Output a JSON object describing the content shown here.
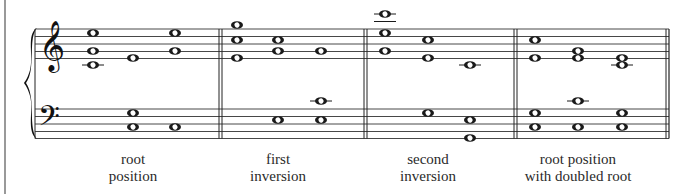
{
  "figure": {
    "colors": {
      "ink": "#1a1a1a",
      "background": "#ffffff"
    }
  },
  "staves": {
    "treble_clef": "treble-clef",
    "bass_clef": "bass-clef",
    "treble_lines_y": [
      29,
      36.5,
      44,
      51.5,
      58.5
    ],
    "bass_lines_y": [
      109,
      116.5,
      124,
      131.5,
      138.5
    ]
  },
  "measures": [
    {
      "label_line1": "root",
      "label_line2": "position",
      "label_x": 133,
      "chords": [
        {
          "x": 93,
          "notes": [
            {
              "y": 33,
              "staff": "treble"
            },
            {
              "y": 51,
              "staff": "treble"
            },
            {
              "y": 65,
              "staff": "treble",
              "ledger": true
            }
          ]
        },
        {
          "x": 133,
          "notes": [
            {
              "y": 58,
              "staff": "treble"
            },
            {
              "y": 113,
              "staff": "bass"
            },
            {
              "y": 127,
              "staff": "bass"
            }
          ]
        },
        {
          "x": 175,
          "notes": [
            {
              "y": 33,
              "staff": "treble"
            },
            {
              "y": 51,
              "staff": "treble"
            },
            {
              "y": 127,
              "staff": "bass"
            }
          ]
        }
      ]
    },
    {
      "label_line1": "first",
      "label_line2": "inversion",
      "label_x": 278,
      "chords": [
        {
          "x": 237,
          "notes": [
            {
              "y": 25,
              "staff": "treble"
            },
            {
              "y": 40,
              "staff": "treble"
            },
            {
              "y": 58,
              "staff": "treble"
            }
          ]
        },
        {
          "x": 278,
          "notes": [
            {
              "y": 40,
              "staff": "treble"
            },
            {
              "y": 51,
              "staff": "treble"
            },
            {
              "y": 120,
              "staff": "bass"
            }
          ]
        },
        {
          "x": 321,
          "notes": [
            {
              "y": 51,
              "staff": "treble"
            },
            {
              "y": 101,
              "staff": "bass",
              "ledger": true
            },
            {
              "y": 120,
              "staff": "bass"
            }
          ]
        }
      ]
    },
    {
      "label_line1": "second",
      "label_line2": "inversion",
      "label_x": 428,
      "chords": [
        {
          "x": 385,
          "notes": [
            {
              "y": 14,
              "staff": "treble",
              "ledger_above": true
            },
            {
              "y": 33,
              "staff": "treble"
            },
            {
              "y": 51,
              "staff": "treble"
            }
          ]
        },
        {
          "x": 428,
          "notes": [
            {
              "y": 40,
              "staff": "treble"
            },
            {
              "y": 58,
              "staff": "treble"
            },
            {
              "y": 113,
              "staff": "bass"
            }
          ]
        },
        {
          "x": 470,
          "notes": [
            {
              "y": 65,
              "staff": "treble",
              "ledger": true
            },
            {
              "y": 120,
              "staff": "bass"
            },
            {
              "y": 138,
              "staff": "bass"
            }
          ]
        }
      ]
    },
    {
      "label_line1": "root position",
      "label_line2": "with doubled root",
      "label_x": 578,
      "chords": [
        {
          "x": 535,
          "notes": [
            {
              "y": 40,
              "staff": "treble"
            },
            {
              "y": 58,
              "staff": "treble"
            },
            {
              "y": 113,
              "staff": "bass"
            },
            {
              "y": 127,
              "staff": "bass"
            }
          ]
        },
        {
          "x": 578,
          "notes": [
            {
              "y": 51,
              "staff": "treble"
            },
            {
              "y": 58,
              "staff": "treble"
            },
            {
              "y": 101,
              "staff": "bass",
              "ledger": true
            },
            {
              "y": 127,
              "staff": "bass"
            }
          ]
        },
        {
          "x": 622,
          "notes": [
            {
              "y": 58,
              "staff": "treble"
            },
            {
              "y": 65,
              "staff": "treble",
              "ledger": true
            },
            {
              "y": 113,
              "staff": "bass"
            },
            {
              "y": 127,
              "staff": "bass"
            }
          ]
        }
      ]
    }
  ],
  "barlines": [
    {
      "x": 219,
      "type": "double"
    },
    {
      "x": 364,
      "type": "double"
    },
    {
      "x": 514,
      "type": "double"
    },
    {
      "x": 666,
      "type": "final"
    }
  ]
}
